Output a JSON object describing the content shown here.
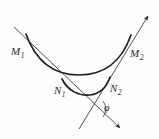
{
  "figure": {
    "background_color": "#fefefe",
    "stroke_color": "#2b2b2b",
    "labels": {
      "m1": {
        "base": "M",
        "sub": "1"
      },
      "m2": {
        "base": "M",
        "sub": "2"
      },
      "n1": {
        "base": "N",
        "sub": "1"
      },
      "n2": {
        "base": "N",
        "sub": "2"
      },
      "phi": "φ"
    },
    "points": {
      "m1": {
        "x": 30,
        "y": 42
      },
      "m2": {
        "x": 126,
        "y": 48
      },
      "n1": {
        "x": 68,
        "y": 86
      },
      "n2": {
        "x": 106,
        "y": 82
      },
      "intersection": {
        "x": 97,
        "y": 110
      }
    },
    "curves": [
      {
        "name": "upper-arc",
        "from": "M1",
        "to": "M2",
        "shape": "concave-up",
        "path": "M 26,34 C 38,66 55,76 79,76 C 104,76 122,66 132,36"
      },
      {
        "name": "lower-arc",
        "from": "N1",
        "to": "N2",
        "shape": "concave-up",
        "path": "M 63,80 C 70,92 80,96 90,95 C 99,94 106,90 110,78"
      }
    ],
    "lines": [
      {
        "name": "secant-left",
        "from": {
          "x": 14,
          "y": 27
        },
        "to": {
          "x": 122,
          "y": 130
        },
        "arrowhead_at": "end",
        "passes_through": [
          "M1",
          "N1"
        ]
      },
      {
        "name": "secant-right",
        "from": {
          "x": 78,
          "y": 130
        },
        "to": {
          "x": 150,
          "y": 14
        },
        "arrowhead_at": "end",
        "passes_through": [
          "N2",
          "M2"
        ]
      }
    ],
    "angle": {
      "name": "phi",
      "symbol": "φ",
      "vertex": {
        "x": 97,
        "y": 110
      },
      "arc_path": "M 106,103 A 12,12 0 0 1 105,117"
    }
  }
}
